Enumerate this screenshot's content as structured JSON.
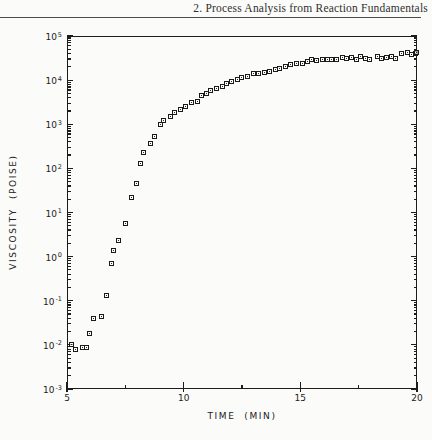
{
  "page": {
    "running_head": "2. Process Analysis from Reaction Fundamentals"
  },
  "chart_data": {
    "type": "scatter",
    "marker": "open-square",
    "ink_color": "#1c1c1c",
    "paper_color": "#fbfbf9",
    "xlabel": "TIME  (MIN)",
    "ylabel": "VISCOSITY  (POISE)",
    "x_axis": {
      "min": 5,
      "max": 20,
      "major_ticks": [
        5,
        10,
        15,
        20
      ],
      "minor_ticks": [
        7.5,
        12.5,
        17.5
      ]
    },
    "y_axis": {
      "scale": "log",
      "min_exponent": -3,
      "max_exponent": 5,
      "major_tick_exponents": [
        5,
        4,
        3,
        2,
        1,
        0,
        -1,
        -2,
        -3
      ]
    },
    "points": [
      [
        5.2,
        0.01
      ],
      [
        5.35,
        0.008
      ],
      [
        5.65,
        0.0085
      ],
      [
        5.85,
        0.0085
      ],
      [
        5.95,
        0.018
      ],
      [
        6.15,
        0.039
      ],
      [
        6.5,
        0.043
      ],
      [
        6.7,
        0.13
      ],
      [
        6.9,
        0.69
      ],
      [
        7.0,
        1.4
      ],
      [
        7.2,
        2.3
      ],
      [
        7.5,
        5.6
      ],
      [
        7.75,
        22
      ],
      [
        8.0,
        46
      ],
      [
        8.15,
        130
      ],
      [
        8.3,
        230
      ],
      [
        8.6,
        370
      ],
      [
        8.75,
        530
      ],
      [
        9.0,
        1000
      ],
      [
        9.15,
        1230
      ],
      [
        9.45,
        1510
      ],
      [
        9.6,
        1870
      ],
      [
        9.85,
        2190
      ],
      [
        10.1,
        2570
      ],
      [
        10.35,
        3020
      ],
      [
        10.6,
        3330
      ],
      [
        10.75,
        4360
      ],
      [
        11.0,
        5050
      ],
      [
        11.15,
        5900
      ],
      [
        11.4,
        6550
      ],
      [
        11.65,
        7300
      ],
      [
        11.85,
        8550
      ],
      [
        12.05,
        9500
      ],
      [
        12.3,
        10500
      ],
      [
        12.5,
        11700
      ],
      [
        12.75,
        12300
      ],
      [
        13.0,
        13700
      ],
      [
        13.2,
        14400
      ],
      [
        13.45,
        15200
      ],
      [
        13.7,
        15900
      ],
      [
        13.95,
        17600
      ],
      [
        14.1,
        18700
      ],
      [
        14.35,
        19800
      ],
      [
        14.6,
        22000
      ],
      [
        14.85,
        23100
      ],
      [
        15.1,
        24300
      ],
      [
        15.3,
        26500
      ],
      [
        15.5,
        29500
      ],
      [
        15.7,
        27500
      ],
      [
        15.95,
        29500
      ],
      [
        16.15,
        29500
      ],
      [
        16.35,
        29500
      ],
      [
        16.55,
        29500
      ],
      [
        16.8,
        33000
      ],
      [
        17.0,
        31000
      ],
      [
        17.2,
        33000
      ],
      [
        17.4,
        29500
      ],
      [
        17.6,
        35000
      ],
      [
        17.8,
        31000
      ],
      [
        17.95,
        29500
      ],
      [
        18.3,
        35000
      ],
      [
        18.5,
        31000
      ],
      [
        18.7,
        33000
      ],
      [
        18.9,
        35000
      ],
      [
        19.1,
        31000
      ],
      [
        19.35,
        39000
      ],
      [
        19.6,
        41000
      ],
      [
        19.75,
        37000
      ],
      [
        19.95,
        40000
      ],
      [
        20.0,
        43000
      ]
    ]
  }
}
